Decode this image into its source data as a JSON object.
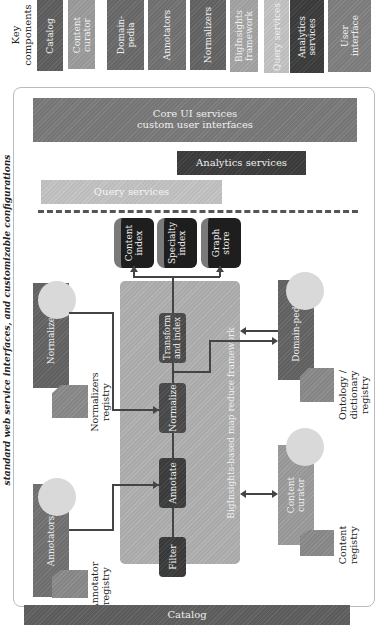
{
  "caption": "standard web service interfaces, and customizable configurations",
  "legend": {
    "title": "Key components",
    "items": [
      {
        "label": "Catalog",
        "color": "#5f5f5f"
      },
      {
        "label": "Content curator",
        "color": "#9c9c9c"
      },
      {
        "label": "Domain-pedia",
        "color": "#6a6a6a"
      },
      {
        "label": "Annotators",
        "color": "#727272"
      },
      {
        "label": "Normalizers",
        "color": "#646464"
      },
      {
        "label": "BigInsights framework",
        "color": "#a4a4a4"
      },
      {
        "label": "Query services",
        "color": "#c4c4c4"
      },
      {
        "label": "Analytics services",
        "color": "#3c3c3c"
      },
      {
        "label": "User interface",
        "color": "#808080"
      }
    ]
  },
  "services": {
    "core_ui": "Core UI services\ncustom user interfaces",
    "core_ui_line1": "Core UI services",
    "core_ui_line2": "custom user interfaces",
    "analytics": "Analytics services",
    "query": "Query services"
  },
  "stores": [
    {
      "label1": "Content",
      "label2": "index"
    },
    {
      "label1": "Specialty",
      "label2": "index"
    },
    {
      "label1": "Graph",
      "label2": "store"
    }
  ],
  "framework": {
    "label": "BigInsights-based map reduce framework",
    "steps": [
      "Filter",
      "Annotate",
      "Normalize",
      "Transform and index"
    ]
  },
  "left_components": {
    "normalizers": {
      "label": "Normalizers",
      "registry1": "Normalizers",
      "registry2": "registry"
    },
    "annotators": {
      "label": "Annotators",
      "registry1": "Annotator",
      "registry2": "registry"
    }
  },
  "right_components": {
    "domain_pedia": {
      "label": "Domain-pedia",
      "registry1": "Ontology /",
      "registry2": "dictionary",
      "registry3": "registry"
    },
    "content_curator": {
      "label1": "Content",
      "label2": "curator",
      "registry1": "Content",
      "registry2": "registry"
    }
  },
  "catalog": {
    "label": "Catalog"
  },
  "colors": {
    "catalog": "#5f5f5f",
    "core_ui": "#7a7a7a",
    "analytics": "#3c3c3c",
    "query": "#c4c4c4",
    "framework": "#b0b0b0",
    "step": "#4a4a4a",
    "store": "#1e1e1e",
    "component_dark": "#646464",
    "curator": "#9c9c9c",
    "bubble": "#d9d9d9"
  }
}
